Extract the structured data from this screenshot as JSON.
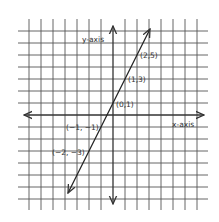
{
  "chart_data": {
    "type": "line",
    "title": "",
    "xlabel": "x-axis",
    "ylabel": "y-axis",
    "equation_implied": "y = 2x + 1",
    "grid": true,
    "xlim": [
      -7.5,
      7.5
    ],
    "ylim": [
      -7.5,
      7.5
    ],
    "series": [
      {
        "name": "line",
        "points": [
          {
            "x": -2,
            "y": -3,
            "label": "(−2, −3)"
          },
          {
            "x": -1,
            "y": -1,
            "label": "(−1, −1)"
          },
          {
            "x": 0,
            "y": 1,
            "label": "(0,1)"
          },
          {
            "x": 1,
            "y": 3,
            "label": "(1,3)"
          },
          {
            "x": 2,
            "y": 5,
            "label": "(2,5)"
          }
        ]
      }
    ],
    "colors": {
      "grid": "#555555",
      "axis": "#333333",
      "line": "#222222",
      "background": "#ffffff"
    }
  },
  "labels": {
    "x_axis": "x-axis",
    "y_axis": "y-axis",
    "p_m2": "(−2, −3)",
    "p_m1": "(−1, −1)",
    "p_0": "(0,1)",
    "p_1": "(1,3)",
    "p_2": "(2,5)"
  }
}
